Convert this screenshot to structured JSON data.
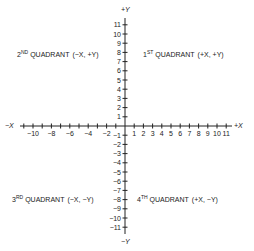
{
  "diagram": {
    "type": "cartesian-coordinate-plane",
    "axes": {
      "x_positive_label": "+X",
      "x_negative_label": "−X",
      "y_positive_label": "+Y",
      "y_negative_label": "−Y"
    },
    "x_ticks_positive": [
      "1",
      "2",
      "3",
      "4",
      "5",
      "6",
      "7",
      "8",
      "9",
      "10",
      "11"
    ],
    "x_ticks_negative": [
      "−10",
      "−8",
      "−6",
      "−4",
      "−2"
    ],
    "y_ticks_positive": [
      "1",
      "2",
      "3",
      "4",
      "5",
      "6",
      "7",
      "8",
      "9",
      "10",
      "11"
    ],
    "y_ticks_negative": [
      "−1",
      "−2",
      "−3",
      "−4",
      "−5",
      "−6",
      "−7",
      "−8",
      "−9",
      "−10",
      "−11"
    ],
    "quadrants": [
      {
        "ordinal": "2",
        "suffix": "ND",
        "name": "QUADRANT",
        "signs": "(−X, +Y)"
      },
      {
        "ordinal": "1",
        "suffix": "ST",
        "name": "QUADRANT",
        "signs": "(+X, +Y)"
      },
      {
        "ordinal": "3",
        "suffix": "RD",
        "name": "QUADRANT",
        "signs": "(−X, −Y)"
      },
      {
        "ordinal": "4",
        "suffix": "TH",
        "name": "QUADRANT",
        "signs": "(+X, −Y)"
      }
    ]
  }
}
